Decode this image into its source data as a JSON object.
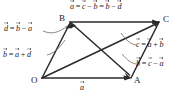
{
  "figure": {
    "kind": "vector-parallelogram-diagram",
    "background_color": "#ffffff",
    "line_color": "#2b2b2b",
    "text_color": "#1a1a1a",
    "vertices": [
      {
        "name": "O",
        "label": "O",
        "x": 42,
        "y": 78
      },
      {
        "name": "A",
        "label": "A",
        "x": 131,
        "y": 78
      },
      {
        "name": "B",
        "label": "B",
        "x": 70,
        "y": 22
      },
      {
        "name": "C",
        "label": "C",
        "x": 159,
        "y": 22
      }
    ],
    "edge_labels": {
      "bottom_OA": {
        "letter": "a"
      },
      "top_BC": {
        "text": "a = c − b = b − d"
      }
    },
    "equations": [
      {
        "id": "top",
        "name": "equation-a-top",
        "lhs": "a",
        "text": "a = c − b = b − d",
        "terms": [
          "a",
          "=",
          "c",
          "−",
          "b",
          "=",
          "b",
          "−",
          "d"
        ]
      },
      {
        "id": "left-d",
        "name": "equation-d-left",
        "lhs": "d",
        "text": "d = b − a",
        "terms": [
          "d",
          "=",
          "b",
          "−",
          "a"
        ]
      },
      {
        "id": "left-b",
        "name": "equation-b-left",
        "lhs": "b",
        "text": "b = a + d",
        "terms": [
          "b",
          "=",
          "a",
          "+",
          "d"
        ]
      },
      {
        "id": "right-c",
        "name": "equation-c-right",
        "lhs": "c",
        "text": "c = a + b",
        "terms": [
          "c",
          "=",
          "a",
          "+",
          "b"
        ]
      },
      {
        "id": "right-b",
        "name": "equation-b-right",
        "lhs": "b",
        "text": "b = c − a",
        "terms": [
          "b",
          "=",
          "c",
          "−",
          "a"
        ]
      },
      {
        "id": "bottom-a",
        "name": "edge-label-a-bottom",
        "lhs": "a",
        "text": "a",
        "terms": [
          "a"
        ]
      }
    ],
    "symbols": {
      "a": "a",
      "b": "b",
      "c": "c",
      "d": "d",
      "equals": "=",
      "minus": "−",
      "plus": "+"
    }
  }
}
